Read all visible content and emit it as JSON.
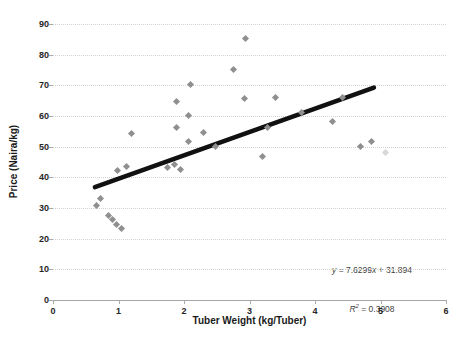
{
  "chart_data": {
    "type": "scatter",
    "title": "",
    "xlabel": "Tuber Weight (kg/Tuber)",
    "ylabel": "Price (Naira/kg)",
    "xlim": [
      0,
      6
    ],
    "ylim": [
      0,
      90
    ],
    "x_ticks": [
      0,
      1,
      2,
      3,
      4,
      5,
      6
    ],
    "y_ticks": [
      0,
      10,
      20,
      30,
      40,
      50,
      60,
      70,
      80,
      90
    ],
    "grid": "horizontal-dotted",
    "legend": "none",
    "point_color": "#8f8f8f",
    "points": [
      {
        "x": 0.67,
        "y": 30.5
      },
      {
        "x": 0.74,
        "y": 33
      },
      {
        "x": 0.85,
        "y": 27.5
      },
      {
        "x": 0.91,
        "y": 26
      },
      {
        "x": 0.98,
        "y": 24.5
      },
      {
        "x": 1.05,
        "y": 23
      },
      {
        "x": 0.99,
        "y": 42
      },
      {
        "x": 1.13,
        "y": 43.5
      },
      {
        "x": 1.2,
        "y": 54
      },
      {
        "x": 1.75,
        "y": 43
      },
      {
        "x": 1.87,
        "y": 44
      },
      {
        "x": 1.95,
        "y": 42.5
      },
      {
        "x": 1.9,
        "y": 64.5
      },
      {
        "x": 1.9,
        "y": 56
      },
      {
        "x": 2.07,
        "y": 60
      },
      {
        "x": 2.07,
        "y": 51.5
      },
      {
        "x": 2.1,
        "y": 70
      },
      {
        "x": 2.3,
        "y": 54.5
      },
      {
        "x": 2.49,
        "y": 50
      },
      {
        "x": 2.76,
        "y": 75
      },
      {
        "x": 2.95,
        "y": 85
      },
      {
        "x": 2.93,
        "y": 65.5
      },
      {
        "x": 3.2,
        "y": 46.5
      },
      {
        "x": 3.29,
        "y": 56
      },
      {
        "x": 3.4,
        "y": 66
      },
      {
        "x": 3.8,
        "y": 61
      },
      {
        "x": 4.28,
        "y": 58
      },
      {
        "x": 4.43,
        "y": 66
      },
      {
        "x": 4.7,
        "y": 50
      },
      {
        "x": 4.87,
        "y": 51.5
      },
      {
        "x": 5.08,
        "y": 48,
        "faint": true
      }
    ],
    "trendline": {
      "slope": 7.6299,
      "intercept": 31.894,
      "r2": 0.3908,
      "x_start": 0.64,
      "x_end": 4.9,
      "color": "#111111",
      "width": 4.5
    },
    "trendline_label": {
      "var_y": "y",
      "middle": " = 7.6299",
      "var_x": "x",
      "tail": " + 31.894",
      "r_var": "R",
      "r_sup": "2",
      "r_tail": " = 0.3908"
    }
  }
}
